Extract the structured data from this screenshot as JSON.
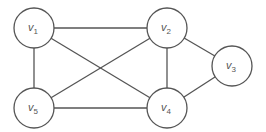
{
  "diagram": {
    "type": "undirected-graph",
    "colors": {
      "stroke": "#555555",
      "fill": "#ffffff",
      "text": "#555555"
    },
    "radius": 20,
    "nodes": [
      {
        "id": "v1",
        "base": "v",
        "sub": "1",
        "x": 34,
        "y": 28
      },
      {
        "id": "v2",
        "base": "v",
        "sub": "2",
        "x": 167,
        "y": 28
      },
      {
        "id": "v3",
        "base": "v",
        "sub": "3",
        "x": 232,
        "y": 66
      },
      {
        "id": "v4",
        "base": "v",
        "sub": "4",
        "x": 167,
        "y": 108
      },
      {
        "id": "v5",
        "base": "v",
        "sub": "5",
        "x": 34,
        "y": 108
      }
    ],
    "edges": [
      [
        "v1",
        "v2"
      ],
      [
        "v1",
        "v4"
      ],
      [
        "v1",
        "v5"
      ],
      [
        "v2",
        "v5"
      ],
      [
        "v2",
        "v4"
      ],
      [
        "v2",
        "v3"
      ],
      [
        "v3",
        "v4"
      ],
      [
        "v4",
        "v5"
      ]
    ]
  }
}
